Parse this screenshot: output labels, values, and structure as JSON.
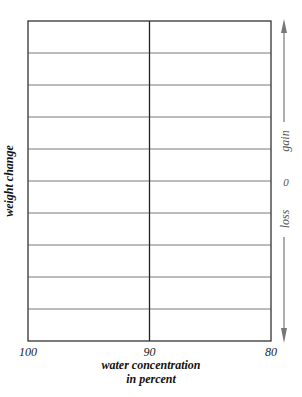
{
  "chart_data": {
    "type": "line",
    "title": "",
    "xlabel_lines": [
      "water concentration",
      "in percent"
    ],
    "ylabel": "weight change",
    "x_ticks": [
      100,
      90,
      80
    ],
    "x_tick_labels": [
      "100",
      "90",
      "80"
    ],
    "xlim": [
      100,
      80
    ],
    "y_rows": 10,
    "y_zero_label": "0",
    "y_direction_labels": {
      "up": "gain",
      "down": "loss"
    },
    "series": [],
    "grid": true,
    "legend": "none"
  }
}
